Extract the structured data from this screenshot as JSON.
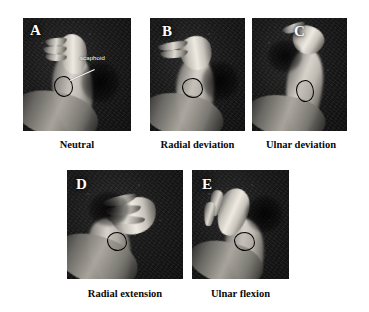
{
  "figure": {
    "background_color": "#ffffff",
    "caption_color": "#0a0a0a",
    "letter_color": "#ffffff",
    "outline_color": "#000000",
    "annotation": {
      "label": "scaphoid",
      "panel": "A"
    },
    "panels": [
      {
        "letter": "A",
        "caption": "Neutral",
        "row": 1,
        "position": 1
      },
      {
        "letter": "B",
        "caption": "Radial deviation",
        "row": 1,
        "position": 2
      },
      {
        "letter": "C",
        "caption": "Ulnar deviation",
        "row": 1,
        "position": 3
      },
      {
        "letter": "D",
        "caption": "Radial extension",
        "row": 2,
        "position": 1
      },
      {
        "letter": "E",
        "caption": "Ulnar flexion",
        "row": 2,
        "position": 2
      }
    ]
  }
}
